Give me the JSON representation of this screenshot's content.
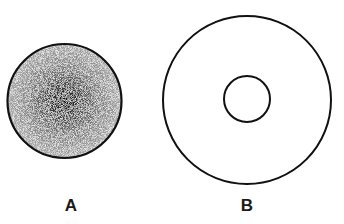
{
  "figures": [
    {
      "id": "A",
      "label": "A",
      "type": "stippled-disc",
      "cx": 64,
      "cy": 101,
      "r": 57,
      "center_color": "#111111",
      "edge_color": "#9a9a9a"
    },
    {
      "id": "B",
      "label": "B",
      "type": "concentric-rings",
      "cx": 247,
      "cy": 100,
      "r_outer": 84,
      "r_inner": 23,
      "stroke": "#111111"
    }
  ],
  "labels": {
    "a": "A",
    "b": "B"
  }
}
